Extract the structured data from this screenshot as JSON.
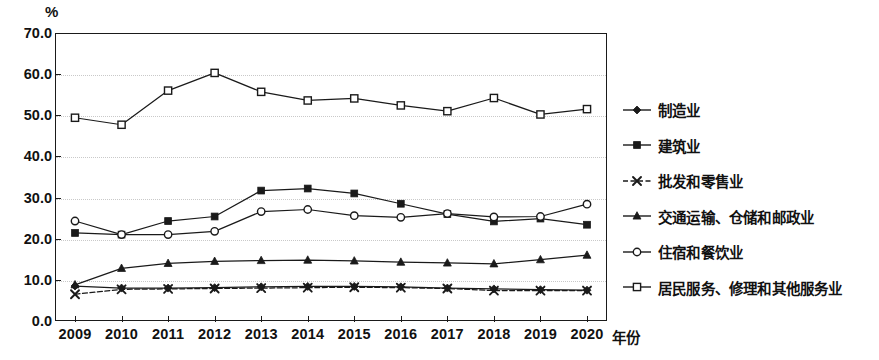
{
  "chart_data": {
    "type": "line",
    "title": "",
    "subtitle": "",
    "xlabel": "年份",
    "ylabel": "%",
    "x": [
      2009,
      2010,
      2011,
      2012,
      2013,
      2014,
      2015,
      2016,
      2017,
      2018,
      2019,
      2020
    ],
    "xticklabels": [
      "2009",
      "2010",
      "2011",
      "2012",
      "2013",
      "2014",
      "2015",
      "2016",
      "2017",
      "2018",
      "2019",
      "2020"
    ],
    "yticklabels": [
      "0.0",
      "10.0",
      "20.0",
      "30.0",
      "40.0",
      "50.0",
      "60.0",
      "70.0"
    ],
    "yticks": [
      0,
      10,
      20,
      30,
      40,
      50,
      60,
      70
    ],
    "ylim": [
      0,
      70
    ],
    "grid": true,
    "grid_style": "dotted-horizontal",
    "legend_position": "right",
    "line_color": "#1a1a1a",
    "series": [
      {
        "name": "制造业",
        "marker": "diamond-filled",
        "linestyle": "solid",
        "values": [
          8.5,
          8.0,
          8.0,
          8.1,
          8.3,
          8.4,
          8.4,
          8.3,
          8.0,
          7.8,
          7.6,
          7.5
        ]
      },
      {
        "name": "建筑业",
        "marker": "square-filled",
        "linestyle": "solid",
        "values": [
          21.4,
          21.0,
          24.3,
          25.4,
          31.7,
          32.2,
          31.0,
          28.5,
          26.0,
          24.2,
          24.9,
          23.4
        ]
      },
      {
        "name": "批发和零售业",
        "marker": "x",
        "linestyle": "dashed",
        "values": [
          6.5,
          7.7,
          7.8,
          7.9,
          8.0,
          8.1,
          8.2,
          8.1,
          7.9,
          7.4,
          7.4,
          7.4
        ]
      },
      {
        "name": "交通运输、仓储和邮政业",
        "marker": "triangle-filled",
        "linestyle": "solid",
        "values": [
          8.8,
          12.8,
          14.0,
          14.5,
          14.7,
          14.8,
          14.6,
          14.3,
          14.1,
          13.9,
          14.9,
          16.0
        ]
      },
      {
        "name": "住宿和餐饮业",
        "marker": "circle-open",
        "linestyle": "solid",
        "values": [
          24.3,
          21.0,
          21.0,
          21.8,
          26.6,
          27.1,
          25.6,
          25.2,
          26.1,
          25.3,
          25.4,
          28.4
        ]
      },
      {
        "name": "居民服务、修理和其他服务业",
        "marker": "square-open",
        "linestyle": "solid",
        "values": [
          49.4,
          47.7,
          56.0,
          60.3,
          55.7,
          53.6,
          54.1,
          52.4,
          51.0,
          54.2,
          50.2,
          51.5
        ]
      }
    ]
  }
}
